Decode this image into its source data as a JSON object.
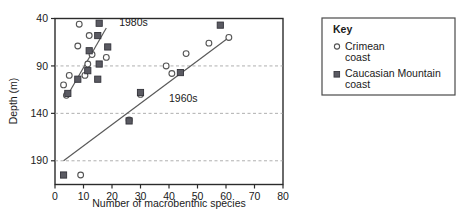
{
  "chart_data": {
    "type": "scatter",
    "title": "",
    "xlabel": "Number of macrobenthic species",
    "ylabel": "Depth (m)",
    "xlim": [
      0,
      80
    ],
    "ylim": [
      40,
      215
    ],
    "y_inverted": true,
    "xticks": [
      0,
      10,
      20,
      30,
      40,
      50,
      60,
      70,
      80
    ],
    "yticks": [
      40,
      90,
      140,
      190
    ],
    "grid": "horizontal-dashed",
    "legend": {
      "title": "Key",
      "position": "right-outside",
      "entries": [
        {
          "marker": "open-circle",
          "label": "Crimean coast",
          "label_line1": "Crimean",
          "label_line2": "coast"
        },
        {
          "marker": "filled-square",
          "label": "Caucasian Mountain coast",
          "label_line1": "Caucasian Mountain",
          "label_line2": "coast"
        }
      ]
    },
    "annotations": [
      {
        "text": "1980s",
        "x": 22.5,
        "y": 48
      },
      {
        "text": "1960s",
        "x": 40.0,
        "y": 128
      }
    ],
    "series": [
      {
        "name": "Crimean coast",
        "marker": "open-circle",
        "color": "#555555",
        "points": [
          [
            8.5,
            46
          ],
          [
            12.0,
            58
          ],
          [
            8.0,
            69
          ],
          [
            13.0,
            78
          ],
          [
            11.5,
            88
          ],
          [
            18.0,
            81
          ],
          [
            10.5,
            100
          ],
          [
            5.0,
            100
          ],
          [
            3.0,
            110
          ],
          [
            4.0,
            121
          ],
          [
            26.0,
            147
          ],
          [
            9.0,
            205
          ],
          [
            39.0,
            90
          ],
          [
            41.0,
            98
          ],
          [
            46.0,
            77
          ],
          [
            54.0,
            66
          ],
          [
            61.0,
            60
          ],
          [
            30.0,
            120
          ]
        ]
      },
      {
        "name": "Caucasian Mountain coast",
        "marker": "filled-square",
        "color": "#5a5a62",
        "points": [
          [
            15.5,
            45
          ],
          [
            15.0,
            58
          ],
          [
            18.5,
            70
          ],
          [
            12.0,
            74
          ],
          [
            15.5,
            88
          ],
          [
            15.0,
            104
          ],
          [
            11.5,
            95
          ],
          [
            8.0,
            104
          ],
          [
            4.5,
            119
          ],
          [
            3.0,
            205
          ],
          [
            30.0,
            118
          ],
          [
            26.0,
            148
          ],
          [
            44.0,
            97
          ],
          [
            58.0,
            47
          ]
        ]
      }
    ],
    "trendlines": [
      {
        "name": "1980s",
        "x1": 4.0,
        "y1": 123,
        "x2": 18.0,
        "y2": 50
      },
      {
        "name": "1960s",
        "x1": 3.0,
        "y1": 190,
        "x2": 61.0,
        "y2": 60
      }
    ]
  }
}
